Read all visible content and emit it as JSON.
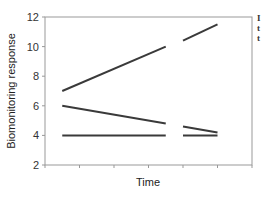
{
  "chart_data": {
    "type": "line",
    "title": "",
    "xlabel": "Time",
    "ylabel": "Biomonitoring response",
    "ylim": [
      2,
      12
    ],
    "yticks": [
      2,
      4,
      6,
      8,
      10,
      12
    ],
    "xticks_count": 7,
    "xtick_labels": [],
    "grid": false,
    "legend": null,
    "x_range": [
      0,
      6
    ],
    "series": [
      {
        "name": "rising",
        "segments": [
          {
            "x": [
              0.5,
              3.5
            ],
            "y": [
              7.0,
              10.0
            ]
          },
          {
            "x": [
              4.0,
              5.0
            ],
            "y": [
              10.4,
              11.5
            ]
          }
        ]
      },
      {
        "name": "declining",
        "segments": [
          {
            "x": [
              0.5,
              3.5
            ],
            "y": [
              6.0,
              4.8
            ]
          },
          {
            "x": [
              4.0,
              5.0
            ],
            "y": [
              4.6,
              4.2
            ]
          }
        ]
      },
      {
        "name": "constant",
        "segments": [
          {
            "x": [
              0.5,
              3.5
            ],
            "y": [
              4.0,
              4.0
            ]
          },
          {
            "x": [
              4.0,
              5.0
            ],
            "y": [
              4.0,
              4.0
            ]
          }
        ]
      }
    ],
    "colors": {
      "line": "#3a3a3a",
      "axis": "#999999",
      "frame": "#999999"
    }
  },
  "side_text": [
    "I",
    "t",
    "t"
  ]
}
